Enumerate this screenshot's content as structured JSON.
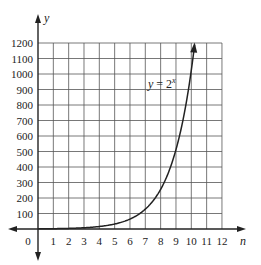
{
  "chart_data": {
    "type": "line",
    "title": "",
    "xlabel": "n",
    "ylabel": "y",
    "annotation": "y = 2^x",
    "annotation_parts": {
      "lhs": "y",
      "eq": " = 2",
      "exp": "x"
    },
    "x_origin_label": "0",
    "xticks": [
      1,
      2,
      3,
      4,
      5,
      6,
      7,
      8,
      9,
      10,
      11,
      12
    ],
    "yticks": [
      100,
      200,
      300,
      400,
      500,
      600,
      700,
      800,
      900,
      1000,
      1100,
      1200
    ],
    "xlim": [
      0,
      12
    ],
    "ylim": [
      0,
      1200
    ],
    "grid": true,
    "series": [
      {
        "name": "y = 2^x",
        "x": [
          0,
          1,
          2,
          3,
          4,
          5,
          6,
          7,
          8,
          9,
          10
        ],
        "y": [
          1,
          2,
          4,
          8,
          16,
          32,
          64,
          128,
          256,
          512,
          1024
        ]
      }
    ]
  },
  "layout": {
    "x0": 38,
    "y0": 229,
    "xunit": 15.33,
    "yunit": 0.155,
    "colors": {
      "grid": "#555555",
      "axis": "#222222",
      "curve": "#222222"
    }
  }
}
